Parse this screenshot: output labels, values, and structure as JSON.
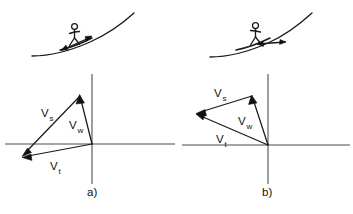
{
  "figure": {
    "background_color": "#ffffff",
    "ink_color": "#111111",
    "axis_color": "#4d4d4d",
    "width": 353,
    "height": 214
  },
  "panels": [
    {
      "id": "a",
      "caption": "a)",
      "scene": {
        "name": "rider-on-upslope-facing-right",
        "rider_icon": "stick-figure-icon",
        "board_icon": "board-icon",
        "surface_icon": "slope-curve-icon",
        "surface_arrow_icon": "double-arrow-icon",
        "surface_arrow_direction": "up-right"
      },
      "origin": {
        "x": 92,
        "y": 144
      },
      "axes": {
        "x_axis": {
          "x1": 5,
          "y1": 144,
          "x2": 175,
          "y2": 144
        },
        "y_axis": {
          "x1": 92,
          "y1": 74,
          "x2": 92,
          "y2": 184
        }
      },
      "vectors": [
        {
          "name": "Vs",
          "label": "V",
          "subscript": "s",
          "from": {
            "x": 80,
            "y": 96
          },
          "to": {
            "x": 23,
            "y": 155
          },
          "label_pos": {
            "x": 43,
            "y": 115
          },
          "description": "surf velocity, from wave tip down-left"
        },
        {
          "name": "Vw",
          "label": "V",
          "subscript": "w",
          "from": {
            "x": 92,
            "y": 144
          },
          "to": {
            "x": 80,
            "y": 96
          },
          "label_pos": {
            "x": 71,
            "y": 128
          },
          "description": "wave velocity, from origin up-left"
        },
        {
          "name": "Vt",
          "label": "V",
          "subscript": "t",
          "from": {
            "x": 92,
            "y": 144
          },
          "to": {
            "x": 23,
            "y": 157
          },
          "label_pos": {
            "x": 52,
            "y": 167
          },
          "description": "total velocity, from origin to lower-left"
        }
      ]
    },
    {
      "id": "b",
      "caption": "b)",
      "scene": {
        "name": "rider-on-upslope-facing-left",
        "rider_icon": "stick-figure-icon",
        "board_icon": "board-icon",
        "surface_icon": "slope-curve-icon",
        "surface_arrow_icon": "double-arrow-icon",
        "surface_arrow_direction": "down-right"
      },
      "origin": {
        "x": 268,
        "y": 145
      },
      "axes": {
        "x_axis": {
          "x1": 182,
          "y1": 145,
          "x2": 350,
          "y2": 145
        },
        "y_axis": {
          "x1": 268,
          "y1": 74,
          "x2": 268,
          "y2": 184
        }
      },
      "vectors": [
        {
          "name": "Vs",
          "label": "V",
          "subscript": "s",
          "from": {
            "x": 252,
            "y": 96
          },
          "to": {
            "x": 197,
            "y": 113
          },
          "label_pos": {
            "x": 217,
            "y": 95
          },
          "description": "surf velocity, from wave tip to the left"
        },
        {
          "name": "Vw",
          "label": "V",
          "subscript": "w",
          "from": {
            "x": 268,
            "y": 145
          },
          "to": {
            "x": 252,
            "y": 96
          },
          "label_pos": {
            "x": 240,
            "y": 124
          },
          "description": "wave velocity, from origin up-left"
        },
        {
          "name": "Vt",
          "label": "V",
          "subscript": "t",
          "from": {
            "x": 268,
            "y": 145
          },
          "to": {
            "x": 197,
            "y": 115
          },
          "label_pos": {
            "x": 218,
            "y": 141
          },
          "description": "total velocity, from origin to the left"
        }
      ]
    }
  ]
}
